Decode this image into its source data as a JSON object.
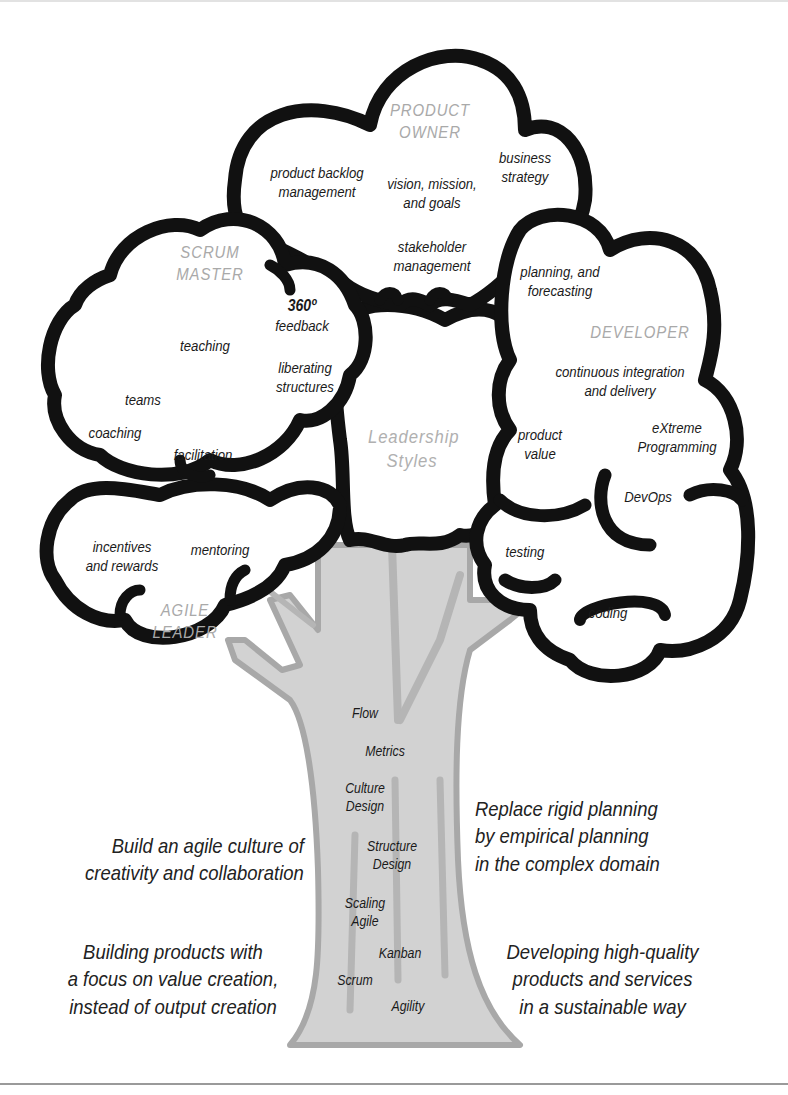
{
  "diagram": {
    "center_title": [
      "Leadership",
      "Styles"
    ],
    "colors": {
      "cloud_outline": "#111111",
      "trunk_fill": "#d2d2d2",
      "trunk_stroke": "#a8a8a8",
      "role_label": "#a9a9a9",
      "text": "#1a1a1a"
    },
    "clouds": {
      "product_owner": {
        "title": [
          "PRODUCT",
          "OWNER"
        ],
        "items": [
          [
            "product backlog",
            "management"
          ],
          [
            "vision, mission,",
            "and goals"
          ],
          [
            "business",
            "strategy"
          ],
          [
            "stakeholder",
            "management"
          ]
        ]
      },
      "scrum_master": {
        "title": [
          "SCRUM",
          "MASTER"
        ],
        "items": [
          [
            "360º",
            "feedback"
          ],
          [
            "teaching"
          ],
          [
            "liberating",
            "structures"
          ],
          [
            "teams"
          ],
          [
            "coaching"
          ],
          [
            "facilitation"
          ]
        ]
      },
      "developer": {
        "title": [
          "DEVELOPER"
        ],
        "items": [
          [
            "planning, and",
            "forecasting"
          ],
          [
            "continuous integration",
            "and delivery"
          ],
          [
            "product",
            "value"
          ],
          [
            "eXtreme",
            "Programming"
          ],
          [
            "DevOps"
          ],
          [
            "testing"
          ],
          [
            "coding"
          ]
        ]
      },
      "agile_leader": {
        "title": [
          "AGILE",
          "LEADER"
        ],
        "items": [
          [
            "incentives",
            "and rewards"
          ],
          [
            "mentoring"
          ]
        ]
      }
    },
    "trunk_labels": [
      [
        "Flow"
      ],
      [
        "Metrics"
      ],
      [
        "Culture",
        "Design"
      ],
      [
        "Structure",
        "Design"
      ],
      [
        "Scaling",
        "Agile"
      ],
      [
        "Kanban"
      ],
      [
        "Scrum"
      ],
      [
        "Agility"
      ]
    ],
    "statements": {
      "left_top": [
        "Build an agile culture of",
        "creativity and collaboration"
      ],
      "left_bottom": [
        "Building products with",
        "a focus on value creation,",
        "instead of output creation"
      ],
      "right_top": [
        "Replace rigid planning",
        "by empirical planning",
        "in the complex domain"
      ],
      "right_bottom": [
        "Developing high-quality",
        "products and services",
        "in a sustainable way"
      ]
    }
  }
}
